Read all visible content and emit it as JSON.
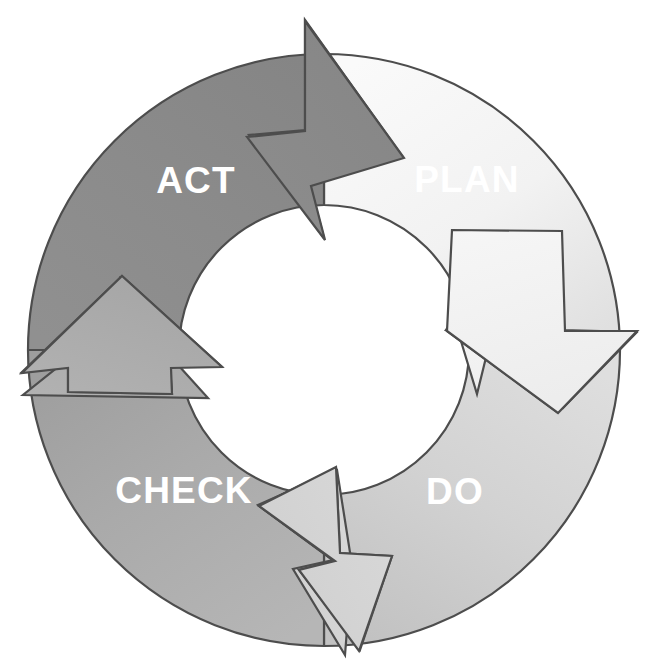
{
  "diagram": {
    "type": "cycle-diagram",
    "background_color": "#ffffff",
    "stroke_color": "#4d4d4d",
    "label_color": "#ffffff",
    "direction": "clockwise",
    "top_text_fragment": "",
    "segments": [
      {
        "id": "plan",
        "label": "PLAN",
        "order": 1,
        "quadrant": "upper-right",
        "fill_start": "#f7f7f7",
        "fill_end": "#e3e3e3",
        "label_x": 467,
        "label_y": 182,
        "arrow_direction": "down",
        "arrow_position": "right"
      },
      {
        "id": "do",
        "label": "DO",
        "order": 2,
        "quadrant": "lower-right",
        "fill_start": "#dcdcdc",
        "fill_end": "#c4c4c4",
        "label_x": 455,
        "label_y": 494,
        "arrow_direction": "left",
        "arrow_position": "bottom"
      },
      {
        "id": "check",
        "label": "CHECK",
        "order": 3,
        "quadrant": "lower-left",
        "fill_start": "#b4b4b4",
        "fill_end": "#a0a0a0",
        "label_x": 184,
        "label_y": 493,
        "arrow_direction": "up",
        "arrow_position": "left"
      },
      {
        "id": "act",
        "label": "ACT",
        "order": 4,
        "quadrant": "upper-left",
        "fill_start": "#8f8f8f",
        "fill_end": "#868686",
        "label_x": 196,
        "label_y": 183,
        "arrow_direction": "right",
        "arrow_position": "top"
      }
    ],
    "geometry": {
      "center_x": 324,
      "center_y": 350,
      "outer_radius": 296,
      "inner_radius": 145
    }
  }
}
